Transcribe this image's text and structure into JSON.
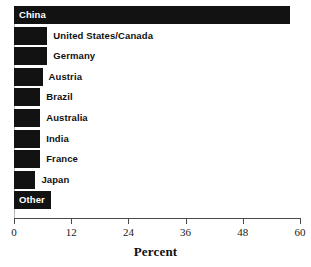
{
  "chart_data": {
    "type": "bar",
    "orientation": "horizontal",
    "title": "",
    "xlabel": "Percent",
    "ylabel": "",
    "xlim": [
      0,
      60
    ],
    "xticks": [
      0,
      12,
      24,
      36,
      48,
      60
    ],
    "xtick_labels": [
      "0",
      "12",
      "24",
      "36",
      "48",
      "60"
    ],
    "grid": false,
    "legend": null,
    "bar_color": "#121212",
    "categories": [
      "China",
      "United States/Canada",
      "Germany",
      "Austria",
      "Brazil",
      "Australia",
      "India",
      "France",
      "Japan",
      "Other"
    ],
    "values": [
      58,
      7,
      7,
      6,
      5.5,
      5.5,
      5.5,
      5.5,
      4.5,
      7.7
    ],
    "bars": [
      {
        "label": "China",
        "value": 58,
        "label_placement": "inside"
      },
      {
        "label": "United States/Canada",
        "value": 7,
        "label_placement": "outside"
      },
      {
        "label": "Germany",
        "value": 7,
        "label_placement": "outside"
      },
      {
        "label": "Austria",
        "value": 6,
        "label_placement": "outside"
      },
      {
        "label": "Brazil",
        "value": 5.5,
        "label_placement": "outside"
      },
      {
        "label": "Australia",
        "value": 5.5,
        "label_placement": "outside"
      },
      {
        "label": "India",
        "value": 5.5,
        "label_placement": "outside"
      },
      {
        "label": "France",
        "value": 5.5,
        "label_placement": "outside"
      },
      {
        "label": "Japan",
        "value": 4.5,
        "label_placement": "outside"
      },
      {
        "label": "Other",
        "value": 7.7,
        "label_placement": "inside"
      }
    ]
  }
}
